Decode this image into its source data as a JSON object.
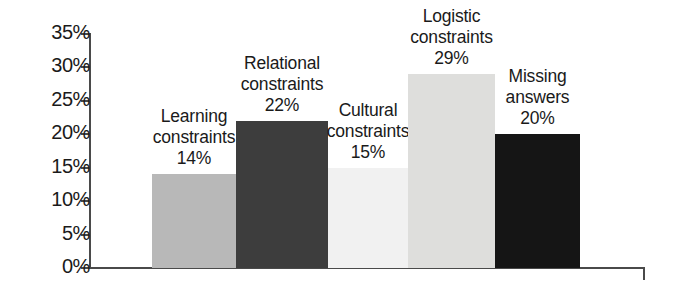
{
  "chart_data": {
    "type": "bar",
    "title": "",
    "subtitle": "",
    "xlabel": "",
    "ylabel": "",
    "ylim": [
      0,
      35
    ],
    "ytick_labels": [
      "0%",
      "5%",
      "10%",
      "15%",
      "20%",
      "25%",
      "30%",
      "35%"
    ],
    "ytick_values": [
      0,
      5,
      10,
      15,
      20,
      25,
      30,
      35
    ],
    "grid": false,
    "legend": "none",
    "categories": [
      "Learning constraints",
      "Relational constraints",
      "Cultural constraints",
      "Logistic constraints",
      "Missing answers"
    ],
    "values": [
      14,
      22,
      15,
      29,
      20
    ],
    "value_labels": [
      "14%",
      "22%",
      "15%",
      "29%",
      "20%"
    ],
    "bar_colors": [
      "#b8b8b8",
      "#3d3d3d",
      "#f1f1f1",
      "#dededc",
      "#151515"
    ]
  },
  "bars": [
    {
      "name": "learning-constraints",
      "label_line1": "Learning",
      "label_line2": "constraints",
      "value_label": "14%",
      "value": 14,
      "color": "#b8b8b8"
    },
    {
      "name": "relational-constraints",
      "label_line1": "Relational",
      "label_line2": "constraints",
      "value_label": "22%",
      "value": 22,
      "color": "#3d3d3d"
    },
    {
      "name": "cultural-constraints",
      "label_line1": "Cultural",
      "label_line2": "constraints",
      "value_label": "15%",
      "value": 15,
      "color": "#f1f1f1"
    },
    {
      "name": "logistic-constraints",
      "label_line1": "Logistic",
      "label_line2": "constraints",
      "value_label": "29%",
      "value": 29,
      "color": "#dededc"
    },
    {
      "name": "missing-answers",
      "label_line1": "Missing",
      "label_line2": "answers",
      "value_label": "20%",
      "value": 20,
      "color": "#151515"
    }
  ],
  "axis": {
    "tick_0": "0%",
    "tick_5": "5%",
    "tick_10": "10%",
    "tick_15": "15%",
    "tick_20": "20%",
    "tick_25": "25%",
    "tick_30": "30%",
    "tick_35": "35%"
  }
}
